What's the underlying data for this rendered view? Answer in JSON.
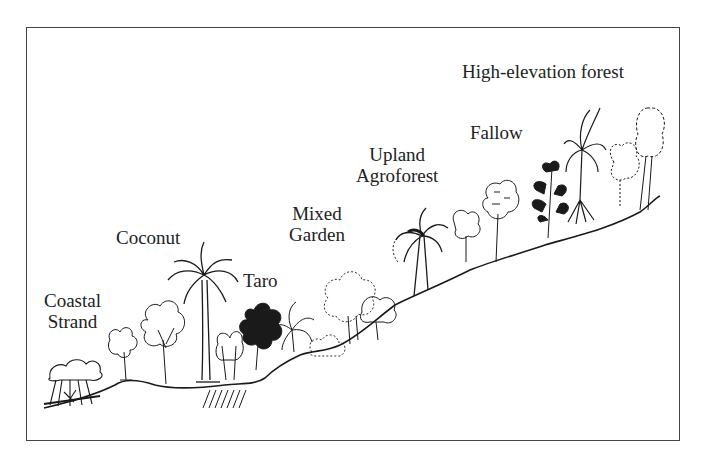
{
  "figure": {
    "type": "landscape-transect-diagram",
    "zones": [
      {
        "id": "coastal-strand",
        "line1": "Coastal",
        "line2": "Strand"
      },
      {
        "id": "coconut",
        "line1": "Coconut"
      },
      {
        "id": "taro",
        "line1": "Taro"
      },
      {
        "id": "mixed-garden",
        "line1": "Mixed",
        "line2": "Garden"
      },
      {
        "id": "upland-agroforest",
        "line1": "Upland",
        "line2": "Agroforest"
      },
      {
        "id": "fallow",
        "line1": "Fallow"
      },
      {
        "id": "high-elevation-forest",
        "line1": "High-elevation forest"
      }
    ],
    "colors": {
      "ink": "#1a1a1a",
      "frame": "#444444",
      "background": "#ffffff"
    }
  }
}
